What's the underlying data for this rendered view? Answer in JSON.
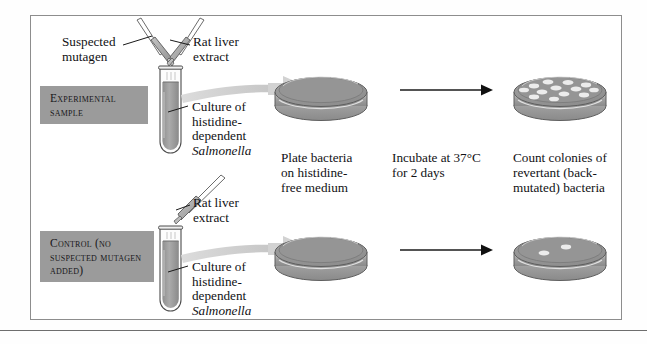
{
  "figure": {
    "title_implicit": "Ames test procedure",
    "background_color": "#fefefe",
    "frame_color": "#8d8d8d"
  },
  "labels": {
    "experimental": "Experimental\nsample",
    "control": "Control\n(no suspected\nmutagen added)",
    "label_box_color": "#9b9b9b"
  },
  "callouts": {
    "suspected_mutagen": "Suspected\nmutagen",
    "rat_liver_extract_top": "Rat liver\nextract",
    "rat_liver_extract_bottom": "Rat liver\nextract",
    "culture_top_line1": "Culture of",
    "culture_top_line2": "histidine-",
    "culture_top_line3": "dependent",
    "culture_top_line4": "Salmonella",
    "culture_bottom_line1": "Culture of",
    "culture_bottom_line2": "histidine-",
    "culture_bottom_line3": "dependent",
    "culture_bottom_line4": "Salmonella"
  },
  "steps": {
    "plate": "Plate bacteria\non histidine-\nfree medium",
    "incubate": "Incubate at 37°C\nfor 2 days",
    "count": "Count colonies of\nrevertant (back-\nmutated) bacteria"
  },
  "dishes": {
    "experimental_result_colonies": 13,
    "control_result_colonies": 2,
    "medium_color": "#949494",
    "rim_color": "#bdbdbd",
    "colony_color": "#e8e8e8"
  },
  "icons": {
    "pipette": "pipette-icon",
    "test_tube": "test-tube-icon",
    "petri_dish": "petri-dish-icon",
    "arrow": "arrow-right-icon",
    "transfer_arrow": "curved-transfer-arrow-icon"
  }
}
